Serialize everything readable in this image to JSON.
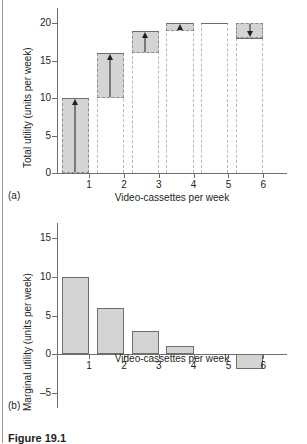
{
  "figure": {
    "caption": "Figure 19.1",
    "panel_a_tag": "(a)",
    "panel_b_tag": "(b)"
  },
  "chart_data": [
    {
      "type": "bar",
      "panel": "(a)",
      "title": "",
      "xlabel": "Video-cassettes per week",
      "ylabel": "Total utility (units per week)",
      "categories": [
        "1",
        "2",
        "3",
        "4",
        "5",
        "6"
      ],
      "values": [
        10,
        16,
        19,
        20,
        20,
        18
      ],
      "previous_values": [
        0,
        10,
        16,
        19,
        20,
        20
      ],
      "increments": [
        10,
        6,
        3,
        1,
        0,
        -2
      ],
      "arrows": [
        "up",
        "up",
        "up",
        "up",
        "none",
        "down"
      ],
      "ylim": [
        0,
        22
      ],
      "yticks": [
        0,
        5,
        10,
        15,
        20
      ],
      "ytick_labels": [
        "0",
        "5",
        "10",
        "15",
        "20"
      ],
      "xticks": [
        1,
        2,
        3,
        4,
        5,
        6
      ],
      "xtick_labels": [
        "1",
        "2",
        "3",
        "4",
        "5",
        "6"
      ],
      "grid": false,
      "legend": "none"
    },
    {
      "type": "bar",
      "panel": "(b)",
      "title": "",
      "xlabel": "Video-cassettes per week",
      "ylabel": "Marginal utility (units per week)",
      "categories": [
        "1",
        "2",
        "3",
        "4",
        "5",
        "6"
      ],
      "values": [
        10,
        6,
        3,
        1,
        0,
        -2
      ],
      "ylim": [
        -7,
        17
      ],
      "yticks": [
        -5,
        0,
        5,
        10,
        15
      ],
      "ytick_labels": [
        "–5",
        "0",
        "5",
        "10",
        "15"
      ],
      "xticks": [
        1,
        2,
        3,
        4,
        5,
        6
      ],
      "xtick_labels": [
        "1",
        "2",
        "3",
        "4",
        "5",
        "6"
      ],
      "grid": false,
      "legend": "none"
    }
  ],
  "colors": {
    "bar_fill": "#d4d4d4",
    "bar_stroke": "#6e6e6e",
    "dashed_stroke": "#8d8d8d",
    "axis": "#6e6e6e",
    "text": "#231f20"
  }
}
